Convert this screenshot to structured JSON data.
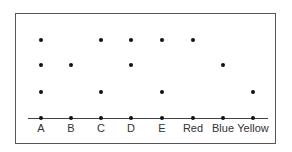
{
  "diagram": {
    "categories": [
      "A",
      "B",
      "C",
      "D",
      "E",
      "Red",
      "Blue",
      "Yellow"
    ],
    "levels": {
      "description": "Dots stacked above each category at discrete rows; row 0 is the baseline",
      "row_y": [
        118,
        92,
        65,
        40
      ]
    },
    "columns": [
      {
        "label": "A",
        "x": 41,
        "rows": [
          0,
          1,
          2,
          3
        ]
      },
      {
        "label": "B",
        "x": 71,
        "rows": [
          0,
          2
        ]
      },
      {
        "label": "C",
        "x": 101,
        "rows": [
          0,
          1,
          3
        ]
      },
      {
        "label": "D",
        "x": 131,
        "rows": [
          0,
          2,
          3
        ]
      },
      {
        "label": "E",
        "x": 162,
        "rows": [
          0,
          1,
          3
        ]
      },
      {
        "label": "Red",
        "x": 193,
        "rows": [
          0,
          3
        ]
      },
      {
        "label": "Blue",
        "x": 223,
        "rows": [
          0,
          2
        ]
      },
      {
        "label": "Yellow",
        "x": 253,
        "rows": [
          0,
          1
        ]
      }
    ],
    "colors": {
      "dot": "#111111",
      "line": "#444444",
      "frame": "#555555",
      "text": "#333333"
    }
  }
}
